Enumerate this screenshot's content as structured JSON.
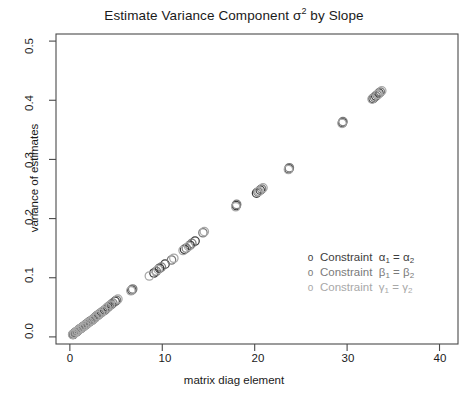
{
  "chart_data": {
    "type": "scatter",
    "title_main": "Estimate Variance Component σ",
    "title_sup": "2",
    "title_tail": " by Slope",
    "xlabel": "matrix diag element",
    "ylabel": "variance of estimates",
    "xlim": [
      -1.5,
      42.0
    ],
    "ylim": [
      -0.012,
      0.512
    ],
    "xticks": [
      0,
      10,
      20,
      30,
      40
    ],
    "xticklabels": [
      "0",
      "10",
      "20",
      "30",
      "40"
    ],
    "yticks": [
      0.0,
      0.1,
      0.2,
      0.3,
      0.4,
      0.5
    ],
    "yticklabels": [
      "0.0",
      "0.1",
      "0.2",
      "0.3",
      "0.4",
      "0.5"
    ],
    "grid": false,
    "frame": true,
    "marker": "open-circle",
    "marker_size": 4.2,
    "legend_position": "center-right",
    "colors": {
      "series1": "#3d3d3d",
      "series2": "#7a7a7a",
      "series3": "#a8a8a8",
      "axis": "#4a4a4a",
      "background": "#ffffff"
    },
    "series": [
      {
        "name": "Constraint α₁ = α₂",
        "color": "#3d3d3d",
        "points": [
          [
            0.35,
            0.004
          ],
          [
            0.55,
            0.007
          ],
          [
            0.75,
            0.009
          ],
          [
            0.95,
            0.012
          ],
          [
            1.15,
            0.014
          ],
          [
            1.4,
            0.017
          ],
          [
            1.65,
            0.02
          ],
          [
            1.9,
            0.023
          ],
          [
            2.15,
            0.026
          ],
          [
            2.45,
            0.029
          ],
          [
            2.75,
            0.033
          ],
          [
            3.05,
            0.037
          ],
          [
            3.4,
            0.041
          ],
          [
            3.75,
            0.045
          ],
          [
            4.1,
            0.05
          ],
          [
            4.5,
            0.055
          ],
          [
            4.9,
            0.06
          ],
          [
            6.7,
            0.079
          ],
          [
            9.1,
            0.108
          ],
          [
            9.7,
            0.116
          ],
          [
            10.3,
            0.123
          ],
          [
            12.4,
            0.148
          ],
          [
            13.0,
            0.155
          ],
          [
            13.55,
            0.162
          ],
          [
            18.0,
            0.222
          ],
          [
            20.2,
            0.243
          ],
          [
            20.6,
            0.248
          ],
          [
            23.7,
            0.284
          ],
          [
            29.5,
            0.362
          ],
          [
            32.8,
            0.403
          ],
          [
            33.1,
            0.407
          ],
          [
            33.45,
            0.412
          ]
        ]
      },
      {
        "name": "Constraint β₁ = β₂",
        "color": "#7a7a7a",
        "points": [
          [
            0.4,
            0.005
          ],
          [
            0.62,
            0.008
          ],
          [
            0.82,
            0.01
          ],
          [
            1.02,
            0.013
          ],
          [
            1.25,
            0.015
          ],
          [
            1.5,
            0.018
          ],
          [
            1.75,
            0.021
          ],
          [
            2.0,
            0.024
          ],
          [
            2.28,
            0.027
          ],
          [
            2.58,
            0.031
          ],
          [
            2.88,
            0.035
          ],
          [
            3.2,
            0.039
          ],
          [
            3.55,
            0.043
          ],
          [
            3.9,
            0.047
          ],
          [
            4.25,
            0.052
          ],
          [
            4.65,
            0.057
          ],
          [
            5.05,
            0.062
          ],
          [
            6.8,
            0.081
          ],
          [
            9.35,
            0.111
          ],
          [
            9.9,
            0.118
          ],
          [
            11.0,
            0.13
          ],
          [
            12.6,
            0.15
          ],
          [
            13.2,
            0.158
          ],
          [
            14.4,
            0.176
          ],
          [
            18.05,
            0.224
          ],
          [
            20.35,
            0.245
          ],
          [
            20.75,
            0.25
          ],
          [
            23.75,
            0.286
          ],
          [
            29.55,
            0.364
          ],
          [
            32.95,
            0.405
          ],
          [
            33.25,
            0.409
          ],
          [
            33.6,
            0.414
          ]
        ]
      },
      {
        "name": "Constraint γ₁ = γ₂",
        "color": "#a8a8a8",
        "points": [
          [
            0.3,
            0.004
          ],
          [
            0.5,
            0.006
          ],
          [
            0.7,
            0.009
          ],
          [
            0.9,
            0.011
          ],
          [
            1.1,
            0.014
          ],
          [
            1.35,
            0.016
          ],
          [
            1.6,
            0.019
          ],
          [
            1.85,
            0.022
          ],
          [
            2.1,
            0.025
          ],
          [
            2.4,
            0.028
          ],
          [
            2.7,
            0.032
          ],
          [
            3.0,
            0.036
          ],
          [
            3.3,
            0.04
          ],
          [
            3.65,
            0.044
          ],
          [
            4.0,
            0.049
          ],
          [
            4.4,
            0.054
          ],
          [
            5.2,
            0.064
          ],
          [
            6.6,
            0.078
          ],
          [
            8.6,
            0.103
          ],
          [
            9.55,
            0.114
          ],
          [
            11.25,
            0.133
          ],
          [
            12.25,
            0.146
          ],
          [
            12.85,
            0.153
          ],
          [
            14.55,
            0.178
          ],
          [
            17.95,
            0.22
          ],
          [
            20.45,
            0.246
          ],
          [
            20.9,
            0.252
          ],
          [
            23.65,
            0.283
          ],
          [
            29.45,
            0.361
          ],
          [
            32.7,
            0.402
          ],
          [
            33.35,
            0.41
          ],
          [
            33.75,
            0.416
          ]
        ]
      }
    ]
  },
  "legend": {
    "items": [
      {
        "symbol": "o",
        "prefix": "Constraint",
        "lhs_base": "α",
        "lhs_sub": "1",
        "eq": "=",
        "rhs_base": "α",
        "rhs_sub": "2"
      },
      {
        "symbol": "o",
        "prefix": "Constraint",
        "lhs_base": "β",
        "lhs_sub": "1",
        "eq": "=",
        "rhs_base": "β",
        "rhs_sub": "2"
      },
      {
        "symbol": "o",
        "prefix": "Constraint",
        "lhs_base": "γ",
        "lhs_sub": "1",
        "eq": "=",
        "rhs_base": "γ",
        "rhs_sub": "2"
      }
    ]
  }
}
